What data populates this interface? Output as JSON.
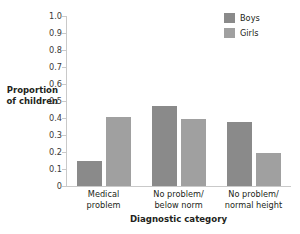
{
  "chart_data": {
    "type": "bar",
    "title": "",
    "subtitle": "",
    "xlabel": "Diagnostic category",
    "ylabel": "Proportion of children",
    "ylabel_lines": [
      "Proportion",
      "of children"
    ],
    "categories": [
      "Medical problem",
      "No problem/below norm",
      "No problem/normal height"
    ],
    "category_lines": [
      [
        "Medical",
        "problem"
      ],
      [
        "No problem/",
        "below norm"
      ],
      [
        "No problem/",
        "normal height"
      ]
    ],
    "series": [
      {
        "name": "Boys",
        "color": "#8a8a8a",
        "values": [
          0.145,
          0.47,
          0.375
        ]
      },
      {
        "name": "Girls",
        "color": "#a0a0a0",
        "values": [
          0.405,
          0.395,
          0.195
        ]
      }
    ],
    "ylim": [
      0,
      1.0
    ],
    "ytick_values": [
      1.0,
      0.9,
      0.8,
      0.7,
      0.6,
      0.5,
      0.4,
      0.3,
      0.2,
      0.1,
      0
    ],
    "ytick_labels": [
      "1.0",
      "0.9",
      "0.8",
      "0.7",
      "0.6",
      "0.5",
      "0.4",
      "0.3",
      "0.2",
      "0.1",
      "0"
    ],
    "grid": false,
    "legend_position": "top-right",
    "legend_entries": [
      "Boys",
      "Girls"
    ],
    "axis_color": "#c9c9c9"
  }
}
